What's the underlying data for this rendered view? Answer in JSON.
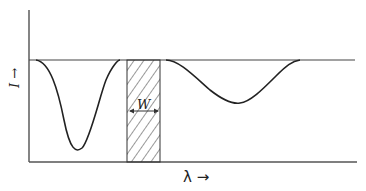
{
  "diagram": {
    "y_axis_label": "I →",
    "x_axis_label": "λ →",
    "window_label": "W",
    "colors": {
      "line": "#222222",
      "background": "#ffffff"
    },
    "elements": [
      {
        "type": "baseline",
        "description": "horizontal continuum level"
      },
      {
        "type": "absorption-dip",
        "description": "narrow deep dip left of window"
      },
      {
        "type": "hatched-band",
        "description": "shaded window of width W"
      },
      {
        "type": "absorption-dip",
        "description": "broad shallow dip right of window"
      }
    ]
  }
}
